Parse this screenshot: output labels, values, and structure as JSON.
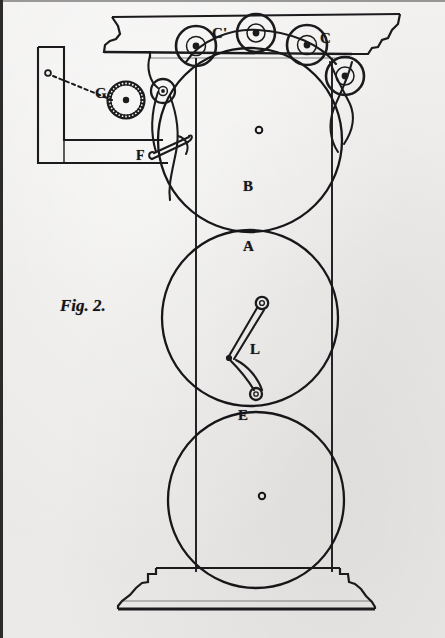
{
  "figure": {
    "caption": "Fig. 2.",
    "caption_x": 60,
    "caption_y": 306,
    "caption_size": 17,
    "background_color": "#ededec",
    "ink_color": "#17171a",
    "width": 445,
    "height": 638
  },
  "labels": [
    {
      "name": "label-c-prime",
      "text": "C'",
      "x": 212,
      "y": 33,
      "size": 15
    },
    {
      "name": "label-c",
      "text": "C",
      "x": 320,
      "y": 38,
      "size": 15
    },
    {
      "name": "label-g",
      "text": "G",
      "x": 95,
      "y": 93,
      "size": 15
    },
    {
      "name": "label-f",
      "text": "F",
      "x": 136,
      "y": 155,
      "size": 14
    },
    {
      "name": "label-b",
      "text": "B",
      "x": 243,
      "y": 186,
      "size": 15
    },
    {
      "name": "label-a",
      "text": "A",
      "x": 243,
      "y": 246,
      "size": 15
    },
    {
      "name": "label-l",
      "text": "L",
      "x": 250,
      "y": 349,
      "size": 15
    },
    {
      "name": "label-e",
      "text": "E",
      "x": 238,
      "y": 415,
      "size": 15
    }
  ],
  "chart_data": {
    "type": "diagram",
    "title": "Fig. 2.",
    "drums": [
      {
        "id": "B",
        "label": "B",
        "cx": 250,
        "cy": 140,
        "r": 92,
        "hub_cx": 259,
        "hub_cy": 130,
        "hub_r": 3
      },
      {
        "id": "A",
        "label": "A",
        "cx": 250,
        "cy": 318,
        "r": 88,
        "hub_cx": 259,
        "hub_cy": 286,
        "hub_r": 0
      },
      {
        "id": "E",
        "label": "E",
        "cx": 256,
        "cy": 500,
        "r": 88,
        "hub_cx": 262,
        "hub_cy": 496,
        "hub_r": 3
      }
    ],
    "rollers": [
      {
        "id": "C-prime",
        "label": "C'",
        "cx": 196,
        "cy": 46,
        "r": 20,
        "hub_r": 3.4
      },
      {
        "id": "C-top",
        "label": "",
        "cx": 256,
        "cy": 33,
        "r": 19,
        "hub_r": 3.4
      },
      {
        "id": "C",
        "label": "C",
        "cx": 307,
        "cy": 45,
        "r": 20,
        "hub_r": 3.4
      },
      {
        "id": "C-lower",
        "label": "",
        "cx": 345,
        "cy": 76,
        "r": 19,
        "hub_r": 3.4
      },
      {
        "id": "small-left",
        "label": "",
        "cx": 163,
        "cy": 91,
        "r": 12,
        "hub_r": 2.6
      }
    ],
    "gear": {
      "id": "G",
      "label": "G",
      "cx": 126,
      "cy": 100,
      "r": 18,
      "teeth": 30,
      "hub_r": 3.2
    },
    "pivot_dot": {
      "cx": 48,
      "cy": 73,
      "r": 2.8
    },
    "vertical_shaft_lines": [
      196,
      332
    ],
    "shaft_y_range": [
      60,
      572
    ],
    "linkage": {
      "id": "L",
      "label": "L",
      "top_eye": [
        262,
        303
      ],
      "knee": [
        228,
        358
      ],
      "foot_eye": [
        253,
        394
      ]
    },
    "lever": {
      "id": "F",
      "label": "F",
      "x1": 152,
      "y1": 158,
      "x2": 188,
      "y2": 143
    },
    "base": {
      "top_y": 568,
      "bottom_y": 609,
      "left_x": 118,
      "right_x": 367
    },
    "entablature": {
      "top_y": 14,
      "bottom_y": 58,
      "left_x": 108,
      "right_x": 400
    }
  }
}
